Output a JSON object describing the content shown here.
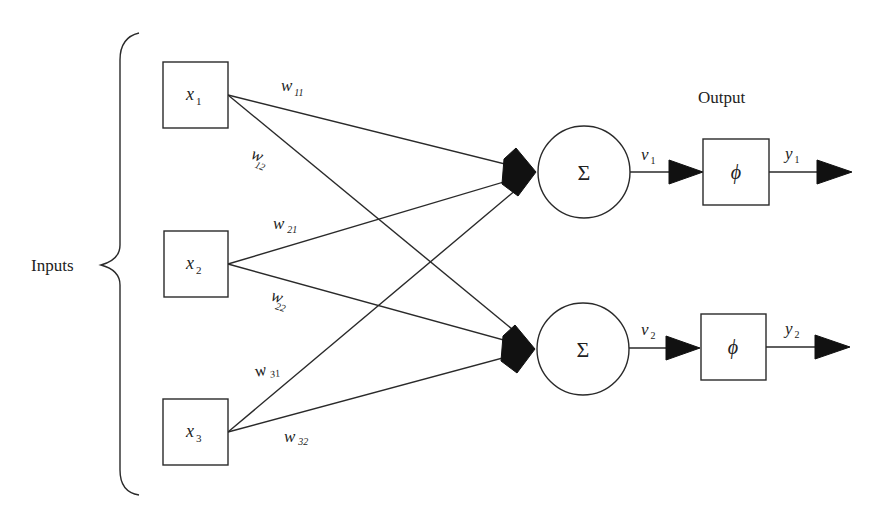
{
  "labels": {
    "inputs": "Inputs",
    "output": "Output"
  },
  "inputs": [
    {
      "id": "x1",
      "symbol": "x",
      "sub": "1"
    },
    {
      "id": "x2",
      "symbol": "x",
      "sub": "2"
    },
    {
      "id": "x3",
      "symbol": "x",
      "sub": "3"
    }
  ],
  "summers": [
    {
      "id": "sum1",
      "symbol": "Σ"
    },
    {
      "id": "sum2",
      "symbol": "Σ"
    }
  ],
  "activations": [
    {
      "id": "phi1",
      "symbol": "ϕ"
    },
    {
      "id": "phi2",
      "symbol": "ϕ"
    }
  ],
  "weights": [
    {
      "from": 0,
      "to": 0,
      "symbol": "w",
      "sub": "11"
    },
    {
      "from": 0,
      "to": 1,
      "symbol": "w",
      "sub": "12"
    },
    {
      "from": 1,
      "to": 0,
      "symbol": "w",
      "sub": "21"
    },
    {
      "from": 1,
      "to": 1,
      "symbol": "w",
      "sub": "22"
    },
    {
      "from": 2,
      "to": 0,
      "symbol": "w",
      "sub": "31"
    },
    {
      "from": 2,
      "to": 1,
      "symbol": "w",
      "sub": "32"
    }
  ],
  "induced_fields": [
    {
      "symbol": "ν",
      "sub": "1"
    },
    {
      "symbol": "ν",
      "sub": "2"
    }
  ],
  "outputs": [
    {
      "symbol": "y",
      "sub": "1"
    },
    {
      "symbol": "y",
      "sub": "2"
    }
  ]
}
